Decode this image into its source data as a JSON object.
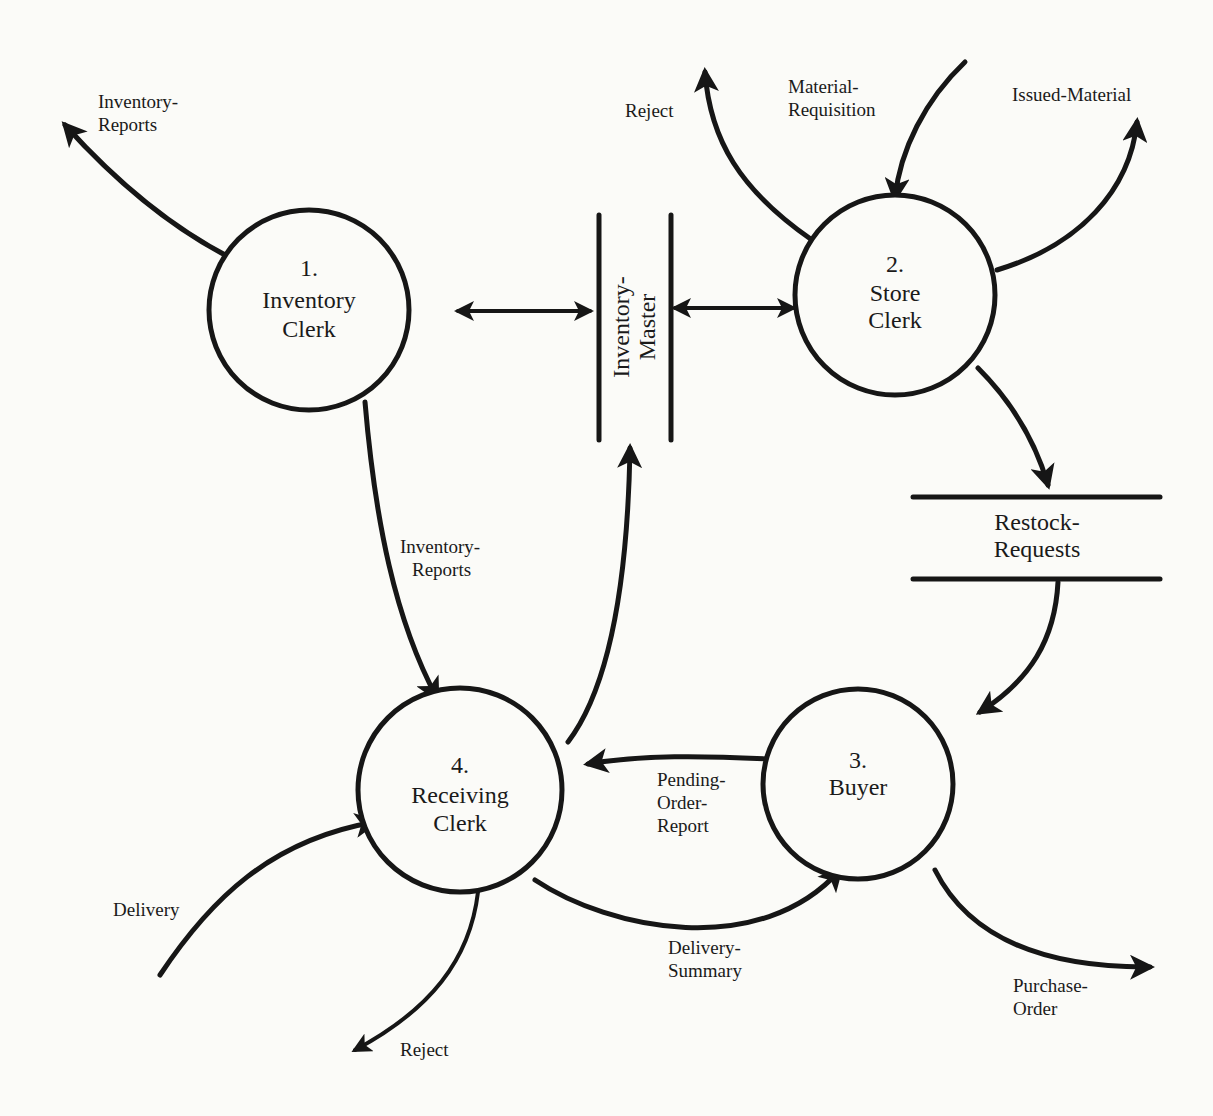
{
  "diagram": {
    "type": "data-flow-diagram",
    "processes": [
      {
        "id": "p1",
        "number": "1.",
        "name_line1": "Inventory",
        "name_line2": "Clerk",
        "cx": 309,
        "cy": 310,
        "r": 100
      },
      {
        "id": "p2",
        "number": "2.",
        "name_line1": "Store",
        "name_line2": "Clerk",
        "cx": 895,
        "cy": 295,
        "r": 100
      },
      {
        "id": "p3",
        "number": "3.",
        "name_line1": "Buyer",
        "name_line2": "",
        "cx": 858,
        "cy": 784,
        "r": 95
      },
      {
        "id": "p4",
        "number": "4.",
        "name_line1": "Receiving",
        "name_line2": "Clerk",
        "cx": 460,
        "cy": 790,
        "r": 102
      }
    ],
    "data_stores": [
      {
        "id": "ds1",
        "name_line1": "Inventory-",
        "name_line2": "Master",
        "orientation": "vertical"
      },
      {
        "id": "ds2",
        "name_line1": "Restock-",
        "name_line2": "Requests",
        "orientation": "horizontal"
      }
    ],
    "flows": [
      {
        "id": "f1",
        "from": "p1",
        "to": "external",
        "label_line1": "Inventory-",
        "label_line2": "Reports"
      },
      {
        "id": "f2",
        "from": "p1",
        "to": "ds1",
        "label_line1": "",
        "label_line2": "",
        "bidirectional": true
      },
      {
        "id": "f3",
        "from": "ds1",
        "to": "p2",
        "label_line1": "",
        "label_line2": "",
        "bidirectional": true
      },
      {
        "id": "f4",
        "from": "p2",
        "to": "external",
        "label_line1": "Reject",
        "label_line2": ""
      },
      {
        "id": "f5",
        "from": "external",
        "to": "p2",
        "label_line1": "Material-",
        "label_line2": "Requisition"
      },
      {
        "id": "f6",
        "from": "p2",
        "to": "external",
        "label_line1": "Issued-Material",
        "label_line2": ""
      },
      {
        "id": "f7",
        "from": "p2",
        "to": "ds2",
        "label_line1": "",
        "label_line2": ""
      },
      {
        "id": "f8",
        "from": "ds2",
        "to": "p3",
        "label_line1": "",
        "label_line2": ""
      },
      {
        "id": "f9",
        "from": "p1",
        "to": "p4",
        "label_line1": "Inventory-",
        "label_line2": "Reports"
      },
      {
        "id": "f10",
        "from": "p4",
        "to": "ds1",
        "label_line1": "",
        "label_line2": ""
      },
      {
        "id": "f11",
        "from": "p3",
        "to": "p4",
        "label_line1": "Pending-",
        "label_line2": "Order-",
        "label_line3": "Report"
      },
      {
        "id": "f12",
        "from": "external",
        "to": "p4",
        "label_line1": "Delivery",
        "label_line2": ""
      },
      {
        "id": "f13",
        "from": "p4",
        "to": "external",
        "label_line1": "Reject",
        "label_line2": ""
      },
      {
        "id": "f14",
        "from": "p4",
        "to": "p3",
        "label_line1": "Delivery-",
        "label_line2": "Summary"
      },
      {
        "id": "f15",
        "from": "p3",
        "to": "external",
        "label_line1": "Purchase-",
        "label_line2": "Order"
      }
    ]
  }
}
